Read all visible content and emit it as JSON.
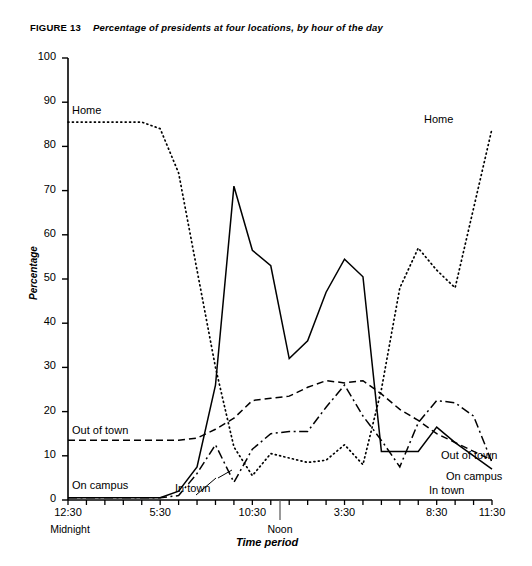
{
  "figure": {
    "number": "FIGURE 13",
    "caption": "Percentage of presidents at four locations, by hour of the day"
  },
  "labels": {
    "home_left": "Home",
    "home_right": "Home",
    "out_of_town_left": "Out of town",
    "out_of_town_right": "Out of town",
    "on_campus_left": "On campus",
    "on_campus_right": "On campus",
    "in_town_left": "In town",
    "in_town_right": "In town",
    "midnight": "Midnight",
    "noon": "Noon"
  },
  "chart_data": {
    "type": "line",
    "title": "Percentage of presidents at four locations, by hour of the day",
    "xlabel": "Time period",
    "ylabel": "Percentage",
    "ylim": [
      0,
      100
    ],
    "ytick_values": [
      0,
      10,
      20,
      30,
      40,
      50,
      60,
      70,
      80,
      90,
      100
    ],
    "ytick_labels": [
      "0",
      "10",
      "20",
      "30",
      "40",
      "50",
      "60",
      "70",
      "80",
      "90",
      "100"
    ],
    "grid": false,
    "legend_position": "inline-annotations",
    "x": [
      "12:30",
      "1:30",
      "2:30",
      "3:30",
      "4:30",
      "5:30",
      "6:30",
      "7:30",
      "8:30",
      "9:30",
      "10:30",
      "11:30",
      "12:30",
      "1:30",
      "2:30",
      "3:30",
      "4:30",
      "5:30",
      "6:30",
      "7:30",
      "8:30",
      "9:30",
      "10:30",
      "11:30"
    ],
    "xtick_labels": [
      "12:30",
      "5:30",
      "10:30",
      "3:30",
      "8:30",
      "11:30"
    ],
    "xtick_sublabels": [
      "Midnight",
      "",
      "",
      "",
      "",
      ""
    ],
    "noon_marker": "Noon",
    "series": [
      {
        "name": "Home",
        "style": "dotted",
        "values": [
          85.5,
          85.5,
          85.5,
          85.5,
          85.5,
          84.0,
          74.0,
          52.0,
          30.0,
          12.0,
          5.5,
          10.5,
          9.5,
          8.5,
          9.0,
          12.5,
          8.0,
          25.0,
          48.0,
          57.0,
          52.0,
          48.0,
          66.0,
          84.0
        ]
      },
      {
        "name": "On campus",
        "style": "solid",
        "values": [
          0.5,
          0.5,
          0.5,
          0.5,
          0.5,
          0.5,
          2.0,
          7.5,
          26.0,
          71.0,
          56.5,
          53.0,
          32.0,
          36.0,
          47.0,
          54.5,
          50.5,
          11.0,
          11.0,
          11.0,
          16.5,
          13.0,
          10.0,
          7.0
        ]
      },
      {
        "name": "Out of town",
        "style": "dashed",
        "values": [
          13.5,
          13.5,
          13.5,
          13.5,
          13.5,
          13.5,
          13.5,
          14.0,
          16.0,
          18.5,
          22.5,
          23.0,
          23.5,
          25.5,
          27.0,
          26.5,
          27.0,
          24.0,
          20.5,
          18.0,
          15.0,
          13.0,
          11.0,
          9.0
        ]
      },
      {
        "name": "In town",
        "style": "dashdot",
        "values": [
          0.5,
          0.5,
          0.5,
          0.5,
          0.5,
          0.5,
          1.0,
          6.0,
          12.5,
          4.0,
          11.5,
          15.0,
          15.5,
          15.5,
          21.0,
          26.0,
          19.0,
          13.5,
          7.5,
          17.5,
          22.5,
          22.0,
          19.0,
          8.5
        ]
      }
    ]
  },
  "colors": {
    "ink": "#000000",
    "background": "#ffffff"
  }
}
